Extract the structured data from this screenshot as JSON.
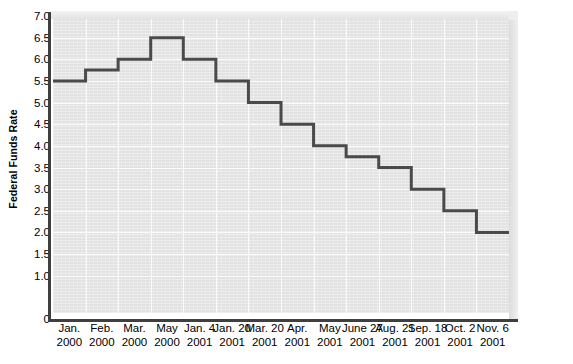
{
  "chart_data": {
    "type": "line",
    "title": "",
    "subtitle": "",
    "xlabel": "",
    "ylabel": "Federal Funds Rate",
    "ylim": [
      0,
      7.0
    ],
    "ytick_step": 0.5,
    "grid": true,
    "legend": "none",
    "style": "step-post",
    "line_color": "#4a4a4a",
    "plot_background": "#e7e7e7",
    "gridline_color": "#fbfbfb",
    "axis_color": "#3f3f3f",
    "categories": [
      "Jan. 2000",
      "Feb. 2000",
      "Mar. 2000",
      "May 2000",
      "Jan. 4 2001",
      "Jan. 20 2001",
      "Mar. 20 2001",
      "Apr. 2001",
      "May 2001",
      "June 27 2001",
      "Aug. 21 2001",
      "Sep. 18 2001",
      "Oct. 2 2001",
      "Nov. 6 2001"
    ],
    "values": [
      5.5,
      5.75,
      6.0,
      6.5,
      6.0,
      5.5,
      5.0,
      4.5,
      4.0,
      3.75,
      3.5,
      3.0,
      2.5,
      2.0
    ],
    "yticks": [
      {
        "value": 7.0,
        "label": "7.0"
      },
      {
        "value": 6.5,
        "label": "6.5"
      },
      {
        "value": 6.0,
        "label": "6.0"
      },
      {
        "value": 5.5,
        "label": "5.5"
      },
      {
        "value": 5.0,
        "label": "5.0"
      },
      {
        "value": 4.5,
        "label": "4.5"
      },
      {
        "value": 4.0,
        "label": "4.0"
      },
      {
        "value": 3.5,
        "label": "3.5"
      },
      {
        "value": 3.0,
        "label": "3.0"
      },
      {
        "value": 2.5,
        "label": "2.5"
      },
      {
        "value": 2.0,
        "label": "2.0"
      },
      {
        "value": 1.5,
        "label": "1.5"
      },
      {
        "value": 1.0,
        "label": "1.0"
      },
      {
        "value": 0.0,
        "label": "0"
      }
    ],
    "xticks": [
      {
        "line1": "Jan.",
        "line2": "2000"
      },
      {
        "line1": "Feb.",
        "line2": "2000"
      },
      {
        "line1": "Mar.",
        "line2": "2000"
      },
      {
        "line1": "May",
        "line2": "2000"
      },
      {
        "line1": "Jan. 4",
        "line2": "2001"
      },
      {
        "line1": "Jan. 20",
        "line2": "2001"
      },
      {
        "line1": "Mar. 20",
        "line2": "2001"
      },
      {
        "line1": "Apr.",
        "line2": "2001"
      },
      {
        "line1": "May",
        "line2": "2001"
      },
      {
        "line1": "June 27",
        "line2": "2001"
      },
      {
        "line1": "Aug. 21",
        "line2": "2001"
      },
      {
        "line1": "Sep. 18",
        "line2": "2001"
      },
      {
        "line1": "Oct. 2",
        "line2": "2001"
      },
      {
        "line1": "Nov. 6",
        "line2": "2001"
      }
    ]
  }
}
